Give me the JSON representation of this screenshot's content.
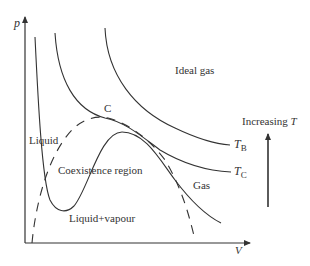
{
  "diagram": {
    "axes": {
      "y_label": "p",
      "x_label": "V"
    },
    "regions": {
      "ideal_gas": "Ideal gas",
      "liquid": "Liquid",
      "coexistence": "Coexistence region",
      "liquid_vapour": "Liquid+vapour",
      "gas": "Gas"
    },
    "critical_point": "C",
    "isotherms": [
      {
        "name": "T_B",
        "label_main": "T",
        "label_sub": "B"
      },
      {
        "name": "T_C",
        "label_main": "T",
        "label_sub": "C"
      },
      {
        "name": "below_T_C",
        "label_main": "",
        "label_sub": ""
      }
    ],
    "temperature_arrow": {
      "label_prefix": "Increasing ",
      "label_var": "T"
    },
    "colors": {
      "line": "#333333",
      "background": "#ffffff"
    }
  }
}
